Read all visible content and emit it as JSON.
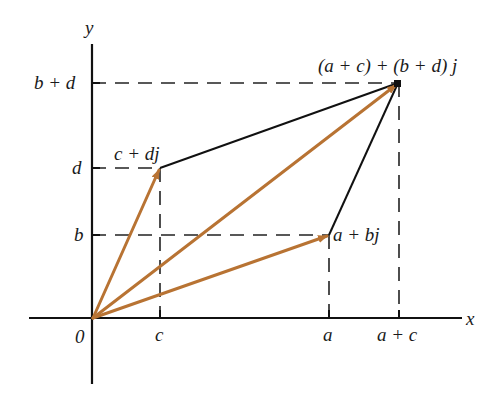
{
  "diagram": {
    "axes": {
      "x_label": "x",
      "y_label": "y",
      "origin_label": "0"
    },
    "x_ticks": [
      {
        "label": "c",
        "px": 160
      },
      {
        "label": "a",
        "px": 329
      },
      {
        "label": "a + c",
        "px": 398
      }
    ],
    "y_ticks": [
      {
        "label": "b",
        "py": 235
      },
      {
        "label": "d",
        "py": 168
      },
      {
        "label": "b + d",
        "py": 83
      }
    ],
    "points": {
      "origin": {
        "label": "0",
        "px": 93,
        "py": 318
      },
      "z1": {
        "label": "a + bj",
        "px": 329,
        "py": 235
      },
      "z2": {
        "label": "c + dj",
        "px": 160,
        "py": 168
      },
      "sum": {
        "label": "(a + c) + (b + d) j",
        "px": 398,
        "py": 83
      }
    },
    "vectors": [
      {
        "from": "origin",
        "to": "z1",
        "name": "a + bj"
      },
      {
        "from": "origin",
        "to": "z2",
        "name": "c + dj"
      },
      {
        "from": "origin",
        "to": "sum",
        "name": "(a + c) + (b + d) j"
      }
    ],
    "parallelogram_edges": [
      {
        "from": "z2",
        "to": "sum"
      },
      {
        "from": "z1",
        "to": "sum"
      }
    ],
    "colors": {
      "vector": "#b87333",
      "axis": "#111111",
      "edge": "#111111",
      "dashed": "#222222"
    }
  }
}
